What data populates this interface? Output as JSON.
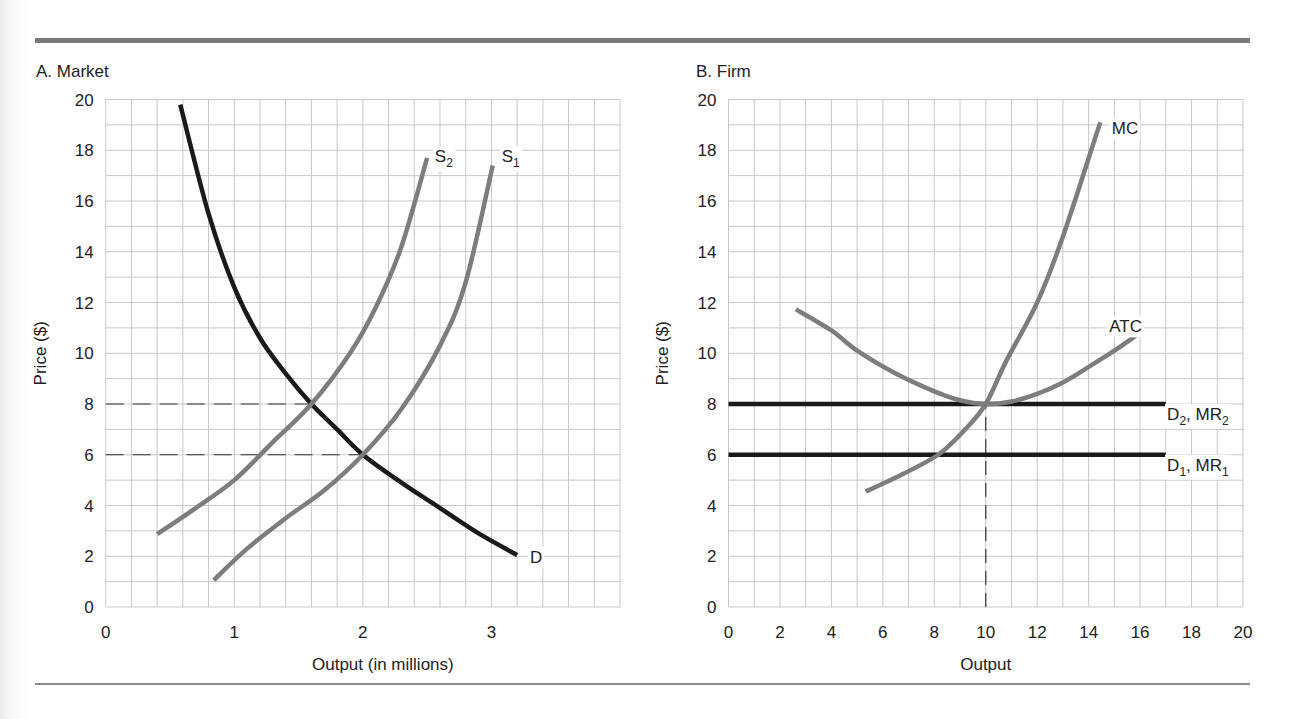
{
  "figure": {
    "panels": [
      {
        "id": "market",
        "title": "A. Market"
      },
      {
        "id": "firm",
        "title": "B. Firm"
      }
    ]
  },
  "colors": {
    "grid": "#c8c8c8",
    "gray_curve": "#7d7d7d",
    "black_curve": "#1a1a1a",
    "rule": "#7a7a7a",
    "text": "#222222"
  },
  "chart_data": [
    {
      "type": "line",
      "title": "A. Market",
      "xlabel": "Output (in millions)",
      "ylabel": "Price ($)",
      "xlim": [
        0,
        4
      ],
      "ylim": [
        0,
        20
      ],
      "xticks": [
        0,
        1,
        2,
        3
      ],
      "yticks": [
        0,
        2,
        4,
        6,
        8,
        10,
        12,
        14,
        16,
        18,
        20
      ],
      "grid": true,
      "grid_step_x": 0.2,
      "grid_step_y": 1,
      "series": [
        {
          "name": "D",
          "label": "D",
          "color": "black",
          "points": [
            [
              0.58,
              19.8
            ],
            [
              0.8,
              15.5
            ],
            [
              1.0,
              12.6
            ],
            [
              1.2,
              10.6
            ],
            [
              1.4,
              9.2
            ],
            [
              1.6,
              8.0
            ],
            [
              1.8,
              7.0
            ],
            [
              2.0,
              6.0
            ],
            [
              2.3,
              4.9
            ],
            [
              2.6,
              3.9
            ],
            [
              2.9,
              2.9
            ],
            [
              3.2,
              2.05
            ]
          ],
          "label_pos": [
            3.3,
            2.0
          ]
        },
        {
          "name": "S2",
          "label": "S",
          "sub": "2",
          "color": "gray",
          "points": [
            [
              0.4,
              2.87
            ],
            [
              0.7,
              3.9
            ],
            [
              1.0,
              5.0
            ],
            [
              1.3,
              6.5
            ],
            [
              1.6,
              8.0
            ],
            [
              1.9,
              10.0
            ],
            [
              2.1,
              11.8
            ],
            [
              2.3,
              14.2
            ],
            [
              2.5,
              17.7
            ]
          ],
          "label_pos": [
            2.56,
            17.8
          ]
        },
        {
          "name": "S1",
          "label": "S",
          "sub": "1",
          "color": "gray",
          "points": [
            [
              0.84,
              1.06
            ],
            [
              1.1,
              2.3
            ],
            [
              1.4,
              3.5
            ],
            [
              1.7,
              4.6
            ],
            [
              2.0,
              6.0
            ],
            [
              2.3,
              7.8
            ],
            [
              2.6,
              10.3
            ],
            [
              2.8,
              12.8
            ],
            [
              3.01,
              17.4
            ]
          ],
          "label_pos": [
            3.08,
            17.8
          ]
        }
      ],
      "reference_lines": [
        {
          "type": "hdashed",
          "y": 8,
          "x_from": 0,
          "x_to": 1.6
        },
        {
          "type": "hdashed",
          "y": 6,
          "x_from": 0,
          "x_to": 2.0
        }
      ],
      "intersections": [
        {
          "curves": [
            "S2",
            "D"
          ],
          "x": 1.6,
          "y": 8
        },
        {
          "curves": [
            "S1",
            "D"
          ],
          "x": 2.0,
          "y": 6
        }
      ]
    },
    {
      "type": "line",
      "title": "B. Firm",
      "xlabel": "Output",
      "ylabel": "Price ($)",
      "xlim": [
        0,
        20
      ],
      "ylim": [
        0,
        20
      ],
      "xticks": [
        0,
        2,
        4,
        6,
        8,
        10,
        12,
        14,
        16,
        18,
        20
      ],
      "yticks": [
        0,
        2,
        4,
        6,
        8,
        10,
        12,
        14,
        16,
        18,
        20
      ],
      "grid": true,
      "grid_step_x": 1,
      "grid_step_y": 1,
      "series": [
        {
          "name": "MC",
          "label": "MC",
          "color": "gray",
          "points": [
            [
              5.33,
              4.55
            ],
            [
              6.5,
              5.1
            ],
            [
              8.15,
              6.0
            ],
            [
              9.2,
              7.0
            ],
            [
              10.0,
              8.0
            ],
            [
              10.8,
              9.7
            ],
            [
              12.0,
              12.0
            ],
            [
              13.0,
              14.6
            ],
            [
              14.45,
              19.1
            ]
          ],
          "label_pos": [
            14.9,
            18.9
          ]
        },
        {
          "name": "ATC",
          "label": "ATC",
          "color": "gray",
          "points": [
            [
              2.62,
              11.73
            ],
            [
              4.0,
              10.9
            ],
            [
              5.0,
              10.1
            ],
            [
              6.5,
              9.2
            ],
            [
              8.0,
              8.5
            ],
            [
              9.0,
              8.15
            ],
            [
              10.0,
              8.0
            ],
            [
              11.0,
              8.1
            ],
            [
              12.0,
              8.4
            ],
            [
              13.0,
              8.85
            ],
            [
              14.0,
              9.46
            ],
            [
              15.0,
              10.1
            ],
            [
              15.85,
              10.7
            ]
          ],
          "label_pos": [
            14.8,
            11.1
          ]
        },
        {
          "name": "D2, MR2",
          "label": "D",
          "sub": "2",
          "label2": ", MR",
          "sub2": "2",
          "color": "black",
          "points": [
            [
              0,
              8
            ],
            [
              17,
              8
            ]
          ],
          "label_pos": [
            17.05,
            7.65
          ]
        },
        {
          "name": "D1, MR1",
          "label": "D",
          "sub": "1",
          "label2": ", MR",
          "sub2": "1",
          "color": "black",
          "points": [
            [
              0,
              6
            ],
            [
              17,
              6
            ]
          ],
          "label_pos": [
            17.05,
            5.65
          ]
        }
      ],
      "reference_lines": [
        {
          "type": "vdashed",
          "x": 10,
          "y_from": 0,
          "y_to": 8
        }
      ],
      "intersections": [
        {
          "curves": [
            "MC",
            "ATC",
            "D2, MR2"
          ],
          "x": 10,
          "y": 8
        },
        {
          "curves": [
            "MC",
            "D1, MR1"
          ],
          "x": 8.15,
          "y": 6
        }
      ]
    }
  ]
}
